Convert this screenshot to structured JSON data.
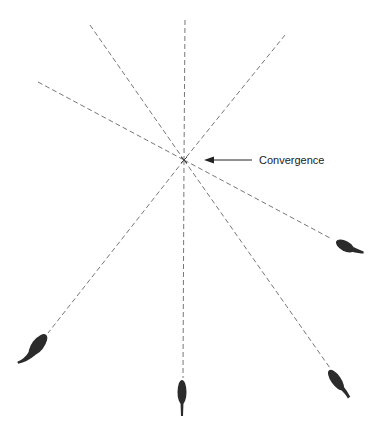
{
  "diagram": {
    "label": "Convergence",
    "center": [
      184,
      160
    ],
    "colors": {
      "ray": "#777777",
      "drop": "#2b2b2b",
      "text": "#222222"
    },
    "rays_from_edge": [
      {
        "from": [
          38,
          82
        ],
        "to": [
          184,
          160
        ]
      },
      {
        "from": [
          90,
          25
        ],
        "to": [
          184,
          160
        ]
      },
      {
        "from": [
          185,
          20
        ],
        "to": [
          184,
          160
        ]
      },
      {
        "from": [
          285,
          35
        ],
        "to": [
          184,
          160
        ]
      }
    ],
    "drops": [
      {
        "name": "lower-left",
        "tip": [
          20,
          365
        ],
        "rayFrom": [
          184,
          160
        ]
      },
      {
        "name": "bottom",
        "tip": [
          183,
          418
        ],
        "rayFrom": [
          184,
          160
        ]
      },
      {
        "name": "lower-right",
        "tip": [
          347,
          396
        ],
        "rayFrom": [
          184,
          160
        ]
      },
      {
        "name": "right",
        "tip": [
          357,
          256
        ],
        "rayFrom": [
          184,
          160
        ]
      }
    ]
  }
}
